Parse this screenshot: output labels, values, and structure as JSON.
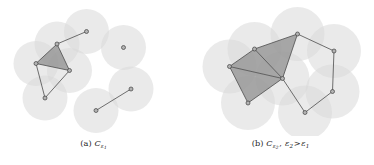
{
  "figure": {
    "type": "two-panel-diagram",
    "background_color": "#ffffff",
    "disc_fill_color": "#d9d9d9",
    "disc_opacity": 0.55,
    "simplex_fill_color": "#8c8c8c",
    "simplex_opacity": 0.72,
    "edge_color": "#4d4d4d",
    "vertex_fill_color": "#b3b3b3",
    "vertex_stroke_color": "#404040",
    "vertex_radius": 2.0,
    "edge_width": 0.8
  },
  "panels": [
    {
      "id": "panel-a",
      "caption": {
        "tag": "(a)",
        "complex_symbol": "C",
        "scale_subscript": "ε",
        "scale_index": "1",
        "full_text": "(a) C_{ε1}"
      },
      "disc_radius": 22.5,
      "points": [
        {
          "name": "p1",
          "x": 57.0,
          "y": 44.0
        },
        {
          "name": "p2",
          "x": 36.0,
          "y": 63.5
        },
        {
          "name": "p3",
          "x": 69.5,
          "y": 70.5
        },
        {
          "name": "p4",
          "x": 45.0,
          "y": 98.0
        },
        {
          "name": "p5",
          "x": 86.5,
          "y": 31.5
        },
        {
          "name": "p6",
          "x": 123.5,
          "y": 47.5
        },
        {
          "name": "p7",
          "x": 131.0,
          "y": 89.0
        },
        {
          "name": "p8",
          "x": 96.0,
          "y": 110.5
        }
      ],
      "edges": [
        {
          "from": "p1",
          "to": "p2"
        },
        {
          "from": "p1",
          "to": "p3"
        },
        {
          "from": "p2",
          "to": "p3"
        },
        {
          "from": "p2",
          "to": "p4"
        },
        {
          "from": "p3",
          "to": "p4"
        },
        {
          "from": "p1",
          "to": "p5"
        },
        {
          "from": "p7",
          "to": "p8"
        }
      ],
      "triangles": [
        {
          "vertices": [
            "p1",
            "p2",
            "p3"
          ]
        }
      ],
      "isolated_points": [
        "p6"
      ]
    },
    {
      "id": "panel-b",
      "caption": {
        "tag": "(b)",
        "complex_symbol": "C",
        "scale_subscript": "ε",
        "scale_index": "2",
        "relation": ">",
        "relation_lhs_subscript": "2",
        "relation_rhs_subscript": "1",
        "full_text": "(b) C_{ε2}, ε2 > ε1"
      },
      "disc_radius": 27.0,
      "points": [
        {
          "name": "q1",
          "x": 42.5,
          "y": 66.5
        },
        {
          "name": "q2",
          "x": 67.5,
          "y": 49.0
        },
        {
          "name": "q3",
          "x": 95.5,
          "y": 78.5
        },
        {
          "name": "q4",
          "x": 61.0,
          "y": 103.0
        },
        {
          "name": "q5",
          "x": 110.5,
          "y": 34.0
        },
        {
          "name": "q6",
          "x": 147.0,
          "y": 51.0
        },
        {
          "name": "q7",
          "x": 145.5,
          "y": 91.5
        },
        {
          "name": "q8",
          "x": 118.0,
          "y": 112.5
        }
      ],
      "edges": [
        {
          "from": "q1",
          "to": "q2"
        },
        {
          "from": "q1",
          "to": "q3"
        },
        {
          "from": "q1",
          "to": "q4"
        },
        {
          "from": "q2",
          "to": "q3"
        },
        {
          "from": "q3",
          "to": "q4"
        },
        {
          "from": "q2",
          "to": "q5"
        },
        {
          "from": "q3",
          "to": "q5"
        },
        {
          "from": "q5",
          "to": "q6"
        },
        {
          "from": "q6",
          "to": "q7"
        },
        {
          "from": "q7",
          "to": "q8"
        },
        {
          "from": "q8",
          "to": "q3"
        }
      ],
      "triangles": [
        {
          "vertices": [
            "q1",
            "q2",
            "q3"
          ]
        },
        {
          "vertices": [
            "q1",
            "q3",
            "q4"
          ]
        },
        {
          "vertices": [
            "q2",
            "q3",
            "q5"
          ]
        }
      ],
      "isolated_points": []
    }
  ]
}
